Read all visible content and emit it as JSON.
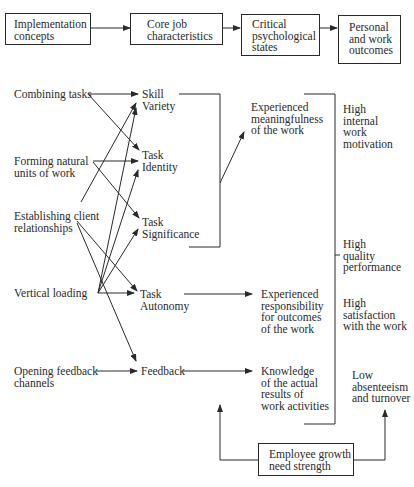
{
  "header_flow": [
    {
      "id": "implementation",
      "label": "Implementation\nconcepts"
    },
    {
      "id": "core",
      "label": "Core job\ncharacteristics"
    },
    {
      "id": "critical",
      "label": "Critical\npsychological\nstates"
    },
    {
      "id": "outcomes",
      "label": "Personal\nand work\noutcomes"
    }
  ],
  "implementation_concepts": [
    {
      "id": "combining",
      "label": "Combining tasks"
    },
    {
      "id": "forming",
      "label": "Forming natural\nunits of work"
    },
    {
      "id": "establishing",
      "label": "Establishing client\nrelationships"
    },
    {
      "id": "vertical",
      "label": "Vertical loading"
    },
    {
      "id": "opening",
      "label": "Opening feedback\nchannels"
    }
  ],
  "core_characteristics": [
    {
      "id": "skill",
      "label": "Skill\nVariety"
    },
    {
      "id": "identity",
      "label": "Task\nIdentity"
    },
    {
      "id": "significance",
      "label": "Task\nSignificance"
    },
    {
      "id": "autonomy",
      "label": "Task\nAutonomy"
    },
    {
      "id": "feedback",
      "label": "Feedback"
    }
  ],
  "psychological_states": [
    {
      "id": "meaningfulness",
      "label": "Experienced\nmeaningfulness\nof the work"
    },
    {
      "id": "responsibility",
      "label": "Experienced\nresponsibility\nfor outcomes\nof the work"
    },
    {
      "id": "knowledge",
      "label": "Knowledge\nof the actual\nresults of\nwork activities"
    }
  ],
  "outcomes": [
    {
      "id": "motivation",
      "label": "High\ninternal\nwork\nmotivation"
    },
    {
      "id": "quality",
      "label": "High\nquality\nperformance"
    },
    {
      "id": "satisfaction",
      "label": "High\nsatisfaction\nwith the work"
    },
    {
      "id": "absenteeism",
      "label": "Low\nabsenteeism\nand turnover"
    }
  ],
  "moderator": {
    "label": "Employee growth\nneed strength"
  },
  "connections": [
    [
      "combining",
      "skill"
    ],
    [
      "combining",
      "identity"
    ],
    [
      "forming",
      "identity"
    ],
    [
      "forming",
      "significance"
    ],
    [
      "establishing",
      "skill"
    ],
    [
      "establishing",
      "autonomy"
    ],
    [
      "establishing",
      "feedback"
    ],
    [
      "vertical",
      "skill"
    ],
    [
      "vertical",
      "identity"
    ],
    [
      "vertical",
      "significance"
    ],
    [
      "vertical",
      "autonomy"
    ],
    [
      "opening",
      "feedback"
    ],
    [
      "skill+identity+significance",
      "meaningfulness"
    ],
    [
      "autonomy",
      "responsibility"
    ],
    [
      "feedback",
      "knowledge"
    ],
    [
      "meaningfulness+responsibility+knowledge",
      "outcomes"
    ],
    [
      "moderator",
      "core->states"
    ],
    [
      "moderator",
      "states->outcomes"
    ]
  ]
}
